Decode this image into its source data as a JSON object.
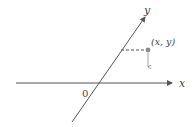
{
  "diagram": {
    "type": "oblique-coordinate-system",
    "colors": {
      "axis": "#555555",
      "point": "#8a8a8a",
      "dashed": "#555555",
      "text": "#444444",
      "background": "#ffffff"
    },
    "x_axis": {
      "label": "x"
    },
    "y_axis": {
      "label": "y"
    },
    "origin": {
      "label": "0"
    },
    "point": {
      "label": "(x, y)"
    }
  }
}
